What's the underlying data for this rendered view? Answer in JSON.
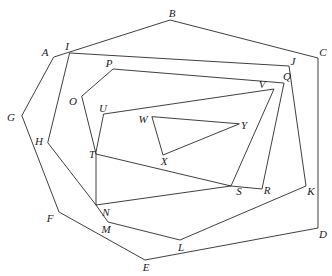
{
  "figure": {
    "canvas": {
      "width": 332,
      "height": 276,
      "background": "#ffffff"
    },
    "style": {
      "stroke": "#2a2a2a",
      "stroke_width": 0.9,
      "label_color": "#1b1b1b",
      "label_font_size": 11,
      "label_style": "italic"
    },
    "points": {
      "A": {
        "label": "A",
        "vertex": [
          54,
          57
        ],
        "label_pos": [
          45,
          52
        ]
      },
      "B": {
        "label": "B",
        "vertex": [
          170,
          20
        ],
        "label_pos": [
          172,
          13
        ]
      },
      "C": {
        "label": "C",
        "vertex": [
          318,
          58
        ],
        "label_pos": [
          323,
          52
        ]
      },
      "D": {
        "label": "D",
        "vertex": [
          318,
          228
        ],
        "label_pos": [
          323,
          234
        ]
      },
      "E": {
        "label": "E",
        "vertex": [
          145,
          260
        ],
        "label_pos": [
          146,
          267
        ]
      },
      "F": {
        "label": "F",
        "vertex": [
          59,
          212
        ],
        "label_pos": [
          50,
          218
        ]
      },
      "G": {
        "label": "G",
        "vertex": [
          22,
          116
        ],
        "label_pos": [
          11,
          117
        ]
      },
      "H": {
        "label": "H",
        "vertex": [
          48,
          143
        ],
        "label_pos": [
          39,
          141
        ]
      },
      "I": {
        "label": "I",
        "vertex": [
          70,
          53
        ],
        "label_pos": [
          67,
          46
        ]
      },
      "J": {
        "label": "J",
        "vertex": [
          289,
          66
        ],
        "label_pos": [
          293,
          61
        ]
      },
      "K": {
        "label": "K",
        "vertex": [
          306,
          186
        ],
        "label_pos": [
          311,
          191
        ]
      },
      "L": {
        "label": "L",
        "vertex": [
          180,
          240
        ],
        "label_pos": [
          181,
          247
        ]
      },
      "M": {
        "label": "M",
        "vertex": [
          108,
          222
        ],
        "label_pos": [
          106,
          229
        ]
      },
      "N": {
        "label": "N",
        "vertex": [
          96,
          205
        ],
        "label_pos": [
          106,
          212
        ]
      },
      "O": {
        "label": "O",
        "vertex": [
          82,
          96
        ],
        "label_pos": [
          73,
          101
        ]
      },
      "P": {
        "label": "P",
        "vertex": [
          113,
          69
        ],
        "label_pos": [
          109,
          63
        ]
      },
      "Q": {
        "label": "Q",
        "vertex": [
          284,
          83
        ],
        "label_pos": [
          287,
          76
        ]
      },
      "R": {
        "label": "R",
        "vertex": [
          262,
          189
        ],
        "label_pos": [
          267,
          190
        ]
      },
      "S": {
        "label": "S",
        "vertex": [
          231,
          186
        ],
        "label_pos": [
          239,
          191
        ]
      },
      "T": {
        "label": "T",
        "vertex": [
          96,
          154
        ],
        "label_pos": [
          92,
          154
        ]
      },
      "U": {
        "label": "U",
        "vertex": [
          104,
          114
        ],
        "label_pos": [
          103,
          108
        ]
      },
      "V": {
        "label": "V",
        "vertex": [
          274,
          89
        ],
        "label_pos": [
          262,
          84
        ]
      },
      "W": {
        "label": "W",
        "vertex": [
          152,
          117
        ],
        "label_pos": [
          143,
          119
        ]
      },
      "X": {
        "label": "X",
        "vertex": [
          163,
          155
        ],
        "label_pos": [
          164,
          161
        ]
      },
      "Y": {
        "label": "Y",
        "vertex": [
          239,
          124
        ],
        "label_pos": [
          244,
          125
        ]
      }
    },
    "shapes": [
      {
        "name": "outer-polygon-ABCDEFG",
        "closed": true,
        "vertices": [
          "A",
          "B",
          "C",
          "D",
          "E",
          "F",
          "G"
        ]
      },
      {
        "name": "second-polygon-IJKLMNH",
        "closed": true,
        "vertices": [
          "I",
          "J",
          "K",
          "L",
          "M",
          "N",
          "H"
        ]
      },
      {
        "name": "third-polygon-OPQRSTN",
        "closed": true,
        "vertices": [
          "O",
          "P",
          "Q",
          "R",
          "S",
          "N",
          "T"
        ]
      },
      {
        "name": "inner-polygon-UVYST",
        "closed": true,
        "vertices": [
          "U",
          "V",
          "S",
          "T"
        ]
      },
      {
        "name": "innermost-triangle-WXY",
        "closed": true,
        "vertices": [
          "W",
          "X",
          "Y"
        ]
      }
    ],
    "vertex_order": [
      "A",
      "B",
      "C",
      "D",
      "E",
      "F",
      "G",
      "H",
      "I",
      "J",
      "K",
      "L",
      "M",
      "N",
      "O",
      "P",
      "Q",
      "R",
      "S",
      "T",
      "U",
      "V",
      "W",
      "X",
      "Y"
    ]
  }
}
